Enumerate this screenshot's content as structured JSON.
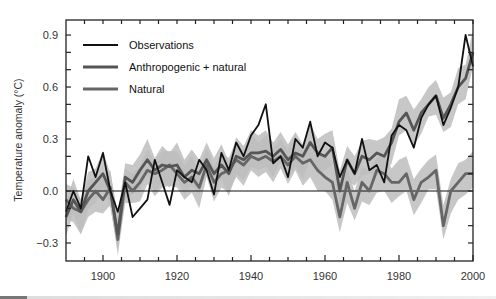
{
  "chart_data": {
    "type": "line",
    "title": "",
    "xlabel": "",
    "ylabel": "Temperature anomaly (°C)",
    "xlim": [
      1890,
      2000
    ],
    "ylim": [
      -0.4,
      1.0
    ],
    "x_ticks": [
      1900,
      1920,
      1940,
      1960,
      1980,
      2000
    ],
    "y_ticks": [
      -0.3,
      0.0,
      0.3,
      0.6,
      0.9
    ],
    "y_tick_labels": [
      "−0.3",
      "0.0",
      "0.3",
      "0.6",
      "0.9"
    ],
    "grid": false,
    "legend_position": "upper left",
    "legend": [
      "Observations",
      "Anthropogenic + natural",
      "Natural"
    ],
    "reference_line": 0.0,
    "x": [
      1890,
      1892,
      1894,
      1896,
      1898,
      1900,
      1902,
      1904,
      1906,
      1908,
      1910,
      1912,
      1914,
      1916,
      1918,
      1920,
      1922,
      1924,
      1926,
      1928,
      1930,
      1932,
      1934,
      1936,
      1938,
      1940,
      1942,
      1944,
      1946,
      1948,
      1950,
      1952,
      1954,
      1956,
      1958,
      1960,
      1962,
      1964,
      1966,
      1968,
      1970,
      1972,
      1974,
      1976,
      1978,
      1980,
      1982,
      1984,
      1986,
      1988,
      1990,
      1992,
      1994,
      1996,
      1998,
      2000
    ],
    "series": [
      {
        "name": "Observations",
        "color": "#111111",
        "values": [
          -0.12,
          0.0,
          -0.1,
          0.2,
          0.08,
          0.22,
          0.0,
          -0.12,
          0.05,
          -0.15,
          -0.1,
          -0.05,
          0.18,
          0.05,
          -0.08,
          0.12,
          0.08,
          0.05,
          0.18,
          0.12,
          -0.02,
          0.22,
          0.12,
          0.28,
          0.2,
          0.32,
          0.38,
          0.5,
          0.16,
          0.2,
          0.08,
          0.3,
          0.25,
          0.4,
          0.2,
          0.28,
          0.25,
          0.08,
          0.18,
          0.1,
          0.3,
          0.12,
          0.15,
          0.05,
          0.32,
          0.38,
          0.35,
          0.25,
          0.42,
          0.5,
          0.55,
          0.38,
          0.48,
          0.6,
          0.9,
          0.72
        ]
      },
      {
        "name": "Anthropogenic + natural",
        "color": "#555555",
        "values": [
          -0.15,
          -0.05,
          -0.12,
          0.0,
          0.05,
          0.1,
          0.0,
          -0.25,
          0.08,
          0.05,
          0.12,
          0.18,
          0.12,
          0.15,
          0.14,
          0.15,
          0.08,
          0.12,
          0.1,
          0.18,
          0.1,
          0.15,
          0.1,
          0.2,
          0.18,
          0.22,
          0.22,
          0.23,
          0.2,
          0.24,
          0.18,
          0.22,
          0.2,
          0.28,
          0.22,
          0.2,
          0.25,
          0.0,
          0.18,
          0.1,
          0.2,
          0.18,
          0.22,
          0.2,
          0.28,
          0.4,
          0.45,
          0.35,
          0.45,
          0.5,
          0.55,
          0.42,
          0.5,
          0.6,
          0.65,
          0.8
        ]
      },
      {
        "name": "Natural",
        "color": "#666666",
        "values": [
          -0.05,
          -0.1,
          -0.12,
          -0.05,
          0.0,
          -0.05,
          0.02,
          -0.28,
          0.05,
          0.0,
          0.05,
          0.12,
          0.1,
          0.12,
          0.15,
          0.1,
          0.05,
          0.08,
          0.02,
          0.15,
          0.05,
          0.1,
          0.12,
          0.18,
          0.15,
          0.2,
          0.18,
          0.2,
          0.17,
          0.2,
          0.15,
          0.2,
          0.16,
          0.18,
          0.12,
          0.08,
          0.05,
          -0.15,
          0.05,
          -0.1,
          0.05,
          0.0,
          0.12,
          0.1,
          0.05,
          0.05,
          0.1,
          -0.05,
          0.05,
          0.08,
          0.12,
          -0.2,
          0.0,
          0.05,
          0.1,
          0.1
        ]
      }
    ],
    "uncertainty_band": {
      "color": "#bdbdbd",
      "description": "shaded model ensemble range around both simulated series"
    }
  },
  "labels": {
    "y_axis": "Temperature anomaly (°C)",
    "legend": {
      "obs": "Observations",
      "anth": "Anthropogenic + natural",
      "nat": "Natural"
    }
  }
}
